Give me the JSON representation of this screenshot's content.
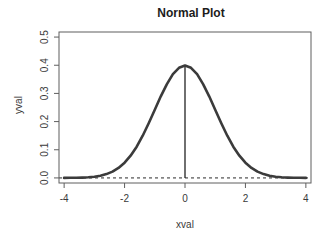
{
  "chart_data": {
    "type": "line",
    "title": "Normal Plot",
    "xlabel": "xval",
    "ylabel": "yval",
    "xlim": [
      -4.17,
      4.17
    ],
    "ylim": [
      -0.018,
      0.518
    ],
    "grid": false,
    "legend": "none",
    "background": "#ffffff",
    "frame_color": "#5f5f5f",
    "text_color": "#3a3a3a",
    "title_color": "#1c1c1c",
    "x_ticks": [
      -4,
      -2,
      0,
      2,
      4
    ],
    "x_tick_labels": [
      "-4",
      "-2",
      "0",
      "2",
      "4"
    ],
    "y_ticks": [
      0.0,
      0.1,
      0.2,
      0.3,
      0.4,
      0.5
    ],
    "y_tick_labels": [
      "0.0",
      "0.1",
      "0.2",
      "0.3",
      "0.4",
      "0.5"
    ],
    "series": [
      {
        "name": "normal-density-curve",
        "style": "solid",
        "color": "#3b3b3b",
        "width": 2.6,
        "x": [
          -4,
          -3.8,
          -3.6,
          -3.4,
          -3.2,
          -3,
          -2.8,
          -2.6,
          -2.4,
          -2.2,
          -2,
          -1.8,
          -1.6,
          -1.4,
          -1.2,
          -1,
          -0.8,
          -0.6,
          -0.4,
          -0.2,
          0,
          0.2,
          0.4,
          0.6,
          0.8,
          1,
          1.2,
          1.4,
          1.6,
          1.8,
          2,
          2.2,
          2.4,
          2.6,
          2.8,
          3,
          3.2,
          3.4,
          3.6,
          3.8,
          4
        ],
        "y": [
          0.00013,
          0.00029,
          0.00061,
          0.00123,
          0.00238,
          0.00443,
          0.00792,
          0.01358,
          0.02239,
          0.03547,
          0.05399,
          0.07895,
          0.11092,
          0.14973,
          0.19419,
          0.24197,
          0.28969,
          0.33322,
          0.36827,
          0.39104,
          0.39894,
          0.39104,
          0.36827,
          0.33322,
          0.28969,
          0.24197,
          0.19419,
          0.14973,
          0.11092,
          0.07895,
          0.05399,
          0.03547,
          0.02239,
          0.01358,
          0.00792,
          0.00443,
          0.00238,
          0.00123,
          0.00061,
          0.00029,
          0.00013
        ]
      }
    ],
    "annotations": [
      {
        "name": "zero-reference-dashed-line",
        "type": "hline",
        "y": 0,
        "style": "dashed",
        "color": "#2a2a2a",
        "width": 1
      },
      {
        "name": "mode-vertical-line",
        "type": "vline",
        "x": 0,
        "y0": 0,
        "y1": 0.39894,
        "style": "solid",
        "color": "#222222",
        "width": 1.3
      }
    ]
  }
}
